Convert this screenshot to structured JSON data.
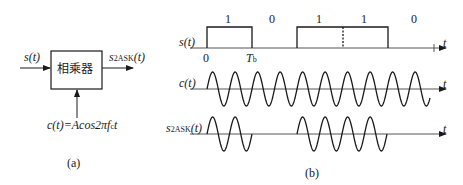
{
  "panel_a": {
    "input_label": "s(t)",
    "output_label_main": "s",
    "output_label_sub": "2ASK",
    "output_label_tail": "(t)",
    "block_label": "相乘器",
    "carrier_label": "c(t)=Acos2πf",
    "carrier_label_sub": "c",
    "carrier_label_tail": "t",
    "caption": "(a)"
  },
  "panel_b": {
    "caption": "(b)",
    "signal_label": "s(t)",
    "carrier_label": "c(t)",
    "ask_label_main": "s",
    "ask_label_sub": "2ASK",
    "ask_label_tail": "(t)",
    "axis_label": "t",
    "origin_label": "0",
    "period_label_main": "T",
    "period_label_sub": "b",
    "bits": [
      "1",
      "0",
      "1",
      "1",
      "0"
    ],
    "cycles_per_bit": 2
  },
  "colors": {
    "line": "#1a1a1a",
    "axis": "#555555"
  }
}
